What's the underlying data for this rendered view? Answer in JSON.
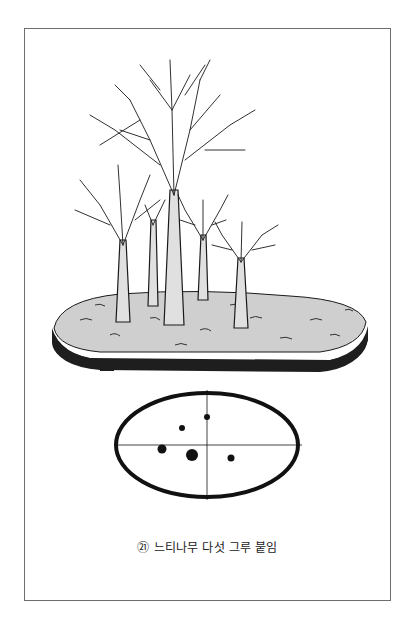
{
  "page": {
    "caption_number": "㉑",
    "caption_text": "느티나무 다섯 그루 붙임"
  },
  "illustration": {
    "subject": "bonsai-forest-planting",
    "tree_count": 5,
    "pot_color": "#1e1e1e",
    "soil_color": "#cfcfcf",
    "line_color": "#1a1a1a"
  },
  "planting_diagram": {
    "ellipse": {
      "cx": 207,
      "cy": 445,
      "rx": 91,
      "ry": 52
    },
    "dots": [
      {
        "x": 207,
        "y": 417,
        "r": 3
      },
      {
        "x": 182,
        "y": 428,
        "r": 3
      },
      {
        "x": 162,
        "y": 449,
        "r": 4.5
      },
      {
        "x": 192,
        "y": 455,
        "r": 6
      },
      {
        "x": 231,
        "y": 458,
        "r": 3.5
      }
    ]
  }
}
